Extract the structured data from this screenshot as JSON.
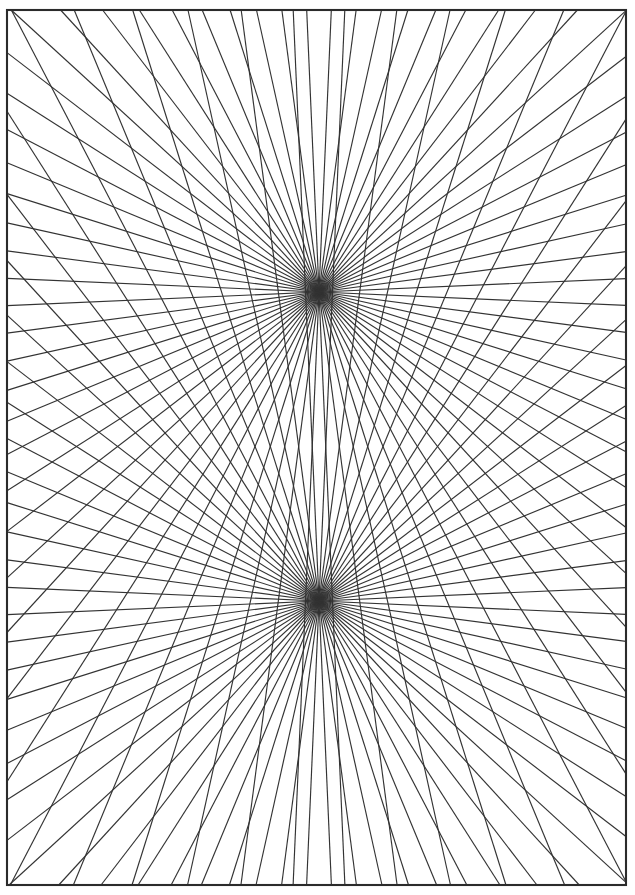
{
  "figure": {
    "canvas": {
      "width": 635,
      "height": 895
    },
    "background_color": "#ffffff",
    "line_color": "#333333",
    "frame_color": "#2b2b2b",
    "frame_stroke_width": 2.1,
    "ray_stroke_width": 1.15
  },
  "frame": {
    "name": "border-rectangle",
    "x": 7,
    "y": 10,
    "width": 619,
    "height": 875
  },
  "chart_data": {
    "type": "scatter",
    "xlabel": "",
    "ylabel": "",
    "xlim": [
      0,
      635
    ],
    "ylim": [
      0,
      895
    ],
    "grid": false,
    "legend": "none",
    "annotations": [
      "Upper hub at (319, 292)",
      "Lower hub at (319, 601)",
      "36 rays per hub, evenly spaced in angle",
      "Rays clipped to border rectangle"
    ],
    "hubs": [
      {
        "name": "upper-hub",
        "x": 319,
        "y": 292,
        "ray_count": 36,
        "angle_offset_deg": 2.5
      },
      {
        "name": "lower-hub",
        "x": 319,
        "y": 601,
        "ray_count": 36,
        "angle_offset_deg": 2.5
      }
    ],
    "clip_rect": {
      "x": 7,
      "y": 10,
      "width": 619,
      "height": 875
    }
  }
}
